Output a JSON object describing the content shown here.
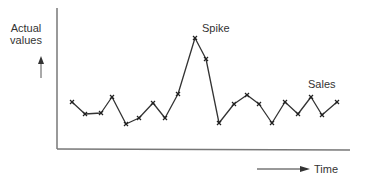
{
  "chart_data": {
    "type": "line",
    "title": "",
    "xlabel": "Time",
    "ylabel": "Actual values",
    "grid": false,
    "legend": "none",
    "series": [
      {
        "name": "Sales",
        "points_px": [
          [
            72,
            102
          ],
          [
            85,
            114
          ],
          [
            101,
            113
          ],
          [
            112,
            97
          ],
          [
            126,
            124
          ],
          [
            139,
            118
          ],
          [
            153,
            103
          ],
          [
            165,
            118
          ],
          [
            178,
            94
          ],
          [
            195,
            38
          ],
          [
            206,
            59
          ],
          [
            219,
            123
          ],
          [
            234,
            104
          ],
          [
            247,
            95
          ],
          [
            259,
            104
          ],
          [
            272,
            123
          ],
          [
            285,
            102
          ],
          [
            298,
            114
          ],
          [
            311,
            97
          ],
          [
            322,
            115
          ],
          [
            337,
            102
          ]
        ],
        "values": [
          48,
          36,
          37,
          52,
          25,
          31,
          46,
          31,
          55,
          111,
          90,
          26,
          45,
          54,
          45,
          26,
          47,
          35,
          52,
          34,
          47
        ],
        "marker": "x",
        "color": "#333333"
      }
    ],
    "annotations": [
      {
        "text": "Spike",
        "at_index": 9
      },
      {
        "text": "Sales",
        "at_index": 20
      }
    ],
    "axes": {
      "y_axis": {
        "x": 57,
        "y_top": 8,
        "y_bottom": 149
      },
      "x_axis": {
        "y": 149,
        "x_left": 57,
        "x_right": 350
      }
    }
  },
  "labels": {
    "ylabel_line1": "Actual",
    "ylabel_line2": "values",
    "spike": "Spike",
    "sales": "Sales",
    "time": "Time"
  }
}
